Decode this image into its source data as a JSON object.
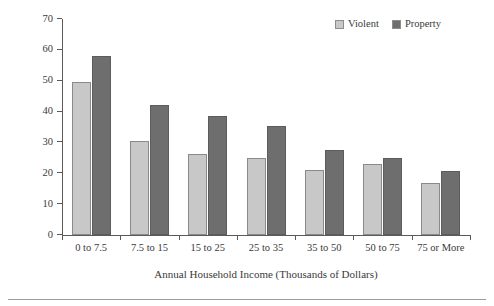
{
  "chart_data": {
    "type": "bar",
    "title": "",
    "subtitle": "",
    "xlabel": "Annual Household Income (Thousands of Dollars)",
    "ylabel": "Rate per 1,000 Persons/Households",
    "categories": [
      "0 to 7.5",
      "7.5 to 15",
      "15 to 25",
      "25 to 35",
      "35 to 50",
      "50 to 75",
      "75 or More"
    ],
    "series": [
      {
        "name": "Violent",
        "color": "#c8c8c8",
        "values": [
          49.5,
          30.6,
          26.2,
          25.0,
          21.2,
          22.9,
          17.0
        ]
      },
      {
        "name": "Property",
        "color": "#6e6e6e",
        "values": [
          58.0,
          42.2,
          38.5,
          35.3,
          27.5,
          25.0,
          20.7
        ]
      }
    ],
    "ylim": [
      0,
      70
    ],
    "yticks": [
      0,
      10,
      20,
      30,
      40,
      50,
      60,
      70
    ],
    "ytick_labels": [
      "0",
      "10",
      "20",
      "30",
      "40",
      "50",
      "60",
      "70"
    ],
    "grid": false,
    "legend_position": "top-right"
  },
  "legend": {
    "entries": [
      {
        "label": "Violent",
        "swatch": "legend-swatch-violent"
      },
      {
        "label": "Property",
        "swatch": "legend-swatch-property"
      }
    ]
  }
}
